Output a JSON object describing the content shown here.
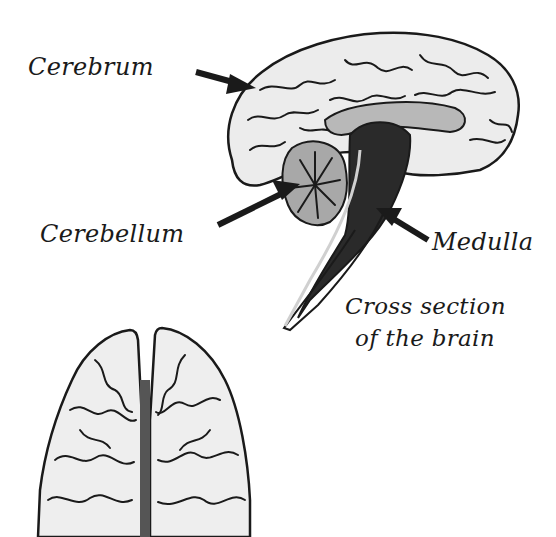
{
  "diagram": {
    "labels": {
      "cerebrum": "Cerebrum",
      "cerebellum": "Cerebellum",
      "medulla": "Medulla"
    },
    "caption": {
      "line1": "Cross section",
      "line2": "of the brain"
    },
    "figures": [
      {
        "name": "sagittal-cross-section",
        "parts": [
          "Cerebrum",
          "Cerebellum",
          "Medulla"
        ]
      },
      {
        "name": "top-view-brain",
        "parts": [
          "left hemisphere",
          "right hemisphere"
        ]
      }
    ],
    "colors": {
      "ink": "#1a1a1a",
      "fill_light": "#e8e8e8",
      "fill_mid": "#a8a8a8",
      "fill_dark": "#2a2a2a",
      "background": "#ffffff"
    }
  }
}
